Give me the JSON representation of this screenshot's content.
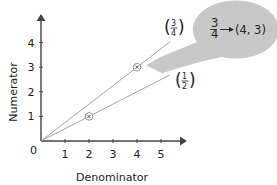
{
  "chart_data": {
    "type": "line",
    "title": "",
    "xlabel": "Denominator",
    "ylabel": "Numerator",
    "xlim": [
      0,
      6
    ],
    "ylim": [
      0,
      5
    ],
    "origin_label": "0",
    "x_ticks": [
      "1",
      "2",
      "3",
      "4",
      "5"
    ],
    "y_ticks": [
      "1",
      "2",
      "3",
      "4"
    ],
    "grid": false,
    "series": [
      {
        "name": "3/4",
        "label_numerator": "3",
        "label_denominator": "4",
        "slope": 0.75,
        "x": [
          0,
          5.4
        ],
        "y": [
          0,
          4.05
        ],
        "marked_point": {
          "x": 4,
          "y": 3
        }
      },
      {
        "name": "1/2",
        "label_numerator": "1",
        "label_denominator": "2",
        "slope": 0.5,
        "x": [
          0,
          5.35
        ],
        "y": [
          0,
          2.675
        ],
        "marked_point": {
          "x": 2,
          "y": 1
        }
      }
    ],
    "annotation": {
      "fraction_numerator": "3",
      "fraction_denominator": "4",
      "arrow": "→",
      "point_text": "(4, 3)",
      "points_to": {
        "x": 4,
        "y": 3
      }
    }
  },
  "colors": {
    "axis": "#444444",
    "line": "#9a9a9a",
    "bubble": "#c8c8c8",
    "text": "#222222"
  }
}
